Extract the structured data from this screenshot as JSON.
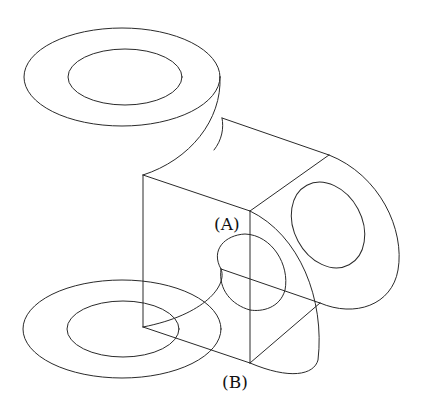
{
  "figure": {
    "stroke_color": "#2a2a2a",
    "background": "#ffffff"
  },
  "labels": {
    "a": "(A)",
    "b": "(B)"
  }
}
